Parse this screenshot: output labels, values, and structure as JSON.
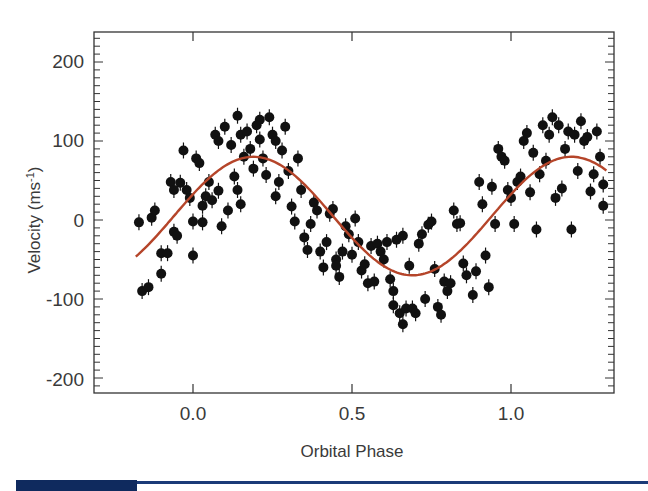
{
  "chart_data": {
    "type": "scatter",
    "title": "",
    "xlabel": "Orbital Phase",
    "ylabel": "Velocity (ms-1)",
    "ylabel_parts": {
      "main": "Velocity (ms",
      "sup": "-1",
      "close": ")"
    },
    "xlim": [
      -0.31,
      1.32
    ],
    "ylim": [
      -216,
      235
    ],
    "x_ticks": [
      0.0,
      0.5,
      1.0
    ],
    "x_tick_labels": [
      "0.0",
      "0.5",
      "1.0"
    ],
    "y_ticks": [
      200,
      100,
      0,
      -100,
      -200
    ],
    "y_tick_labels": [
      "200",
      "100",
      "0",
      "-100",
      "-200"
    ],
    "y_minor_step": 10,
    "grid": false,
    "legend": null,
    "colors": {
      "points": "#111111",
      "model": "#b5452a",
      "frame": "#333333",
      "text": "#3a3a3a"
    },
    "series": [
      {
        "name": "observations",
        "kind": "scatter",
        "points": [
          [
            -0.17,
            -3
          ],
          [
            -0.16,
            -90
          ],
          [
            -0.14,
            -85
          ],
          [
            -0.13,
            3
          ],
          [
            -0.12,
            12
          ],
          [
            -0.1,
            -42
          ],
          [
            -0.1,
            -68
          ],
          [
            -0.08,
            -42
          ],
          [
            -0.07,
            48
          ],
          [
            -0.06,
            38
          ],
          [
            -0.06,
            -15
          ],
          [
            -0.05,
            -20
          ],
          [
            -0.04,
            47
          ],
          [
            -0.03,
            88
          ],
          [
            -0.02,
            38
          ],
          [
            -0.01,
            28
          ],
          [
            0.0,
            -2
          ],
          [
            0.0,
            -45
          ],
          [
            0.01,
            78
          ],
          [
            0.02,
            72
          ],
          [
            0.03,
            18
          ],
          [
            0.03,
            -3
          ],
          [
            0.04,
            30
          ],
          [
            0.05,
            48
          ],
          [
            0.06,
            25
          ],
          [
            0.07,
            108
          ],
          [
            0.08,
            100
          ],
          [
            0.08,
            37
          ],
          [
            0.09,
            -8
          ],
          [
            0.1,
            118
          ],
          [
            0.11,
            12
          ],
          [
            0.12,
            95
          ],
          [
            0.13,
            55
          ],
          [
            0.14,
            38
          ],
          [
            0.14,
            132
          ],
          [
            0.15,
            108
          ],
          [
            0.15,
            20
          ],
          [
            0.16,
            80
          ],
          [
            0.17,
            112
          ],
          [
            0.18,
            90
          ],
          [
            0.19,
            65
          ],
          [
            0.2,
            120
          ],
          [
            0.21,
            127
          ],
          [
            0.21,
            102
          ],
          [
            0.22,
            78
          ],
          [
            0.23,
            57
          ],
          [
            0.24,
            130
          ],
          [
            0.25,
            108
          ],
          [
            0.26,
            30
          ],
          [
            0.26,
            100
          ],
          [
            0.27,
            48
          ],
          [
            0.28,
            88
          ],
          [
            0.29,
            118
          ],
          [
            0.3,
            62
          ],
          [
            0.31,
            17
          ],
          [
            0.32,
            -2
          ],
          [
            0.33,
            78
          ],
          [
            0.34,
            38
          ],
          [
            0.35,
            -22
          ],
          [
            0.36,
            -38
          ],
          [
            0.37,
            -5
          ],
          [
            0.38,
            22
          ],
          [
            0.39,
            12
          ],
          [
            0.4,
            -40
          ],
          [
            0.41,
            -60
          ],
          [
            0.42,
            -28
          ],
          [
            0.43,
            8
          ],
          [
            0.44,
            14
          ],
          [
            0.45,
            -50
          ],
          [
            0.45,
            -58
          ],
          [
            0.46,
            -72
          ],
          [
            0.47,
            -40
          ],
          [
            0.48,
            -8
          ],
          [
            0.49,
            -18
          ],
          [
            0.5,
            -44
          ],
          [
            0.51,
            2
          ],
          [
            0.52,
            -28
          ],
          [
            0.53,
            -64
          ],
          [
            0.54,
            -56
          ],
          [
            0.55,
            -80
          ],
          [
            0.56,
            -33
          ],
          [
            0.57,
            -78
          ],
          [
            0.58,
            -30
          ],
          [
            0.59,
            -40
          ],
          [
            0.6,
            -50
          ],
          [
            0.61,
            -28
          ],
          [
            0.62,
            -75
          ],
          [
            0.63,
            -90
          ],
          [
            0.63,
            -108
          ],
          [
            0.64,
            -25
          ],
          [
            0.65,
            -118
          ],
          [
            0.66,
            -132
          ],
          [
            0.66,
            -20
          ],
          [
            0.67,
            -112
          ],
          [
            0.68,
            -58
          ],
          [
            0.69,
            -112
          ],
          [
            0.7,
            -118
          ],
          [
            0.71,
            -30
          ],
          [
            0.72,
            -18
          ],
          [
            0.73,
            -100
          ],
          [
            0.74,
            -6
          ],
          [
            0.75,
            -2
          ],
          [
            0.76,
            -62
          ],
          [
            0.77,
            -110
          ],
          [
            0.78,
            -120
          ],
          [
            0.79,
            -78
          ],
          [
            0.8,
            -90
          ],
          [
            0.81,
            -80
          ],
          [
            0.82,
            12
          ],
          [
            0.83,
            -5
          ],
          [
            0.84,
            -4
          ],
          [
            0.85,
            -55
          ],
          [
            0.86,
            -70
          ],
          [
            0.88,
            -95
          ],
          [
            0.89,
            -65
          ],
          [
            0.9,
            48
          ],
          [
            0.91,
            20
          ],
          [
            0.92,
            -45
          ],
          [
            0.93,
            -85
          ],
          [
            0.94,
            42
          ],
          [
            0.95,
            -5
          ],
          [
            0.96,
            90
          ],
          [
            0.97,
            80
          ],
          [
            0.98,
            75
          ],
          [
            0.99,
            38
          ],
          [
            1.0,
            28
          ],
          [
            1.01,
            -5
          ],
          [
            1.02,
            48
          ],
          [
            1.03,
            55
          ],
          [
            1.04,
            100
          ],
          [
            1.05,
            110
          ],
          [
            1.06,
            35
          ],
          [
            1.07,
            85
          ],
          [
            1.08,
            -12
          ],
          [
            1.09,
            58
          ],
          [
            1.1,
            120
          ],
          [
            1.11,
            75
          ],
          [
            1.12,
            108
          ],
          [
            1.13,
            130
          ],
          [
            1.14,
            28
          ],
          [
            1.15,
            120
          ],
          [
            1.16,
            40
          ],
          [
            1.17,
            90
          ],
          [
            1.18,
            112
          ],
          [
            1.19,
            -12
          ],
          [
            1.2,
            108
          ],
          [
            1.21,
            62
          ],
          [
            1.22,
            125
          ],
          [
            1.23,
            100
          ],
          [
            1.24,
            105
          ],
          [
            1.25,
            36
          ],
          [
            1.26,
            58
          ],
          [
            1.27,
            112
          ],
          [
            1.28,
            80
          ],
          [
            1.29,
            18
          ],
          [
            1.29,
            45
          ]
        ]
      },
      {
        "name": "orbital fit",
        "kind": "line",
        "model": {
          "gamma": 5,
          "K": 75,
          "phase_of_max": 0.19
        },
        "x_range": [
          -0.18,
          1.3
        ]
      }
    ]
  }
}
